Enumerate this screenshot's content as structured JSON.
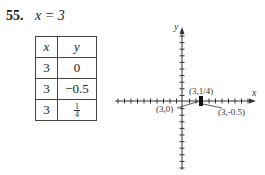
{
  "problem": {
    "number": "55.",
    "equation": "x = 3"
  },
  "table": {
    "headers": [
      "x",
      "y"
    ],
    "rows": [
      {
        "x": "3",
        "y": "0"
      },
      {
        "x": "3",
        "y": "−0.5"
      },
      {
        "x": "3",
        "y_num": "1",
        "y_den": "4"
      }
    ]
  },
  "chart_data": {
    "type": "scatter",
    "title": "",
    "xlabel": "x",
    "ylabel": "y",
    "points": [
      {
        "x": 3,
        "y": 0,
        "label": "(3,0)"
      },
      {
        "x": 3,
        "y": -0.5,
        "label": "(3,-0.5)"
      },
      {
        "x": 3,
        "y": 0.25,
        "label": "(3,1/4)"
      }
    ],
    "xlim": [
      -10,
      10
    ],
    "ylim": [
      -10,
      10
    ],
    "grid": false,
    "ticks": "unit tick marks on both axes"
  },
  "graph": {
    "x_axis_label": "x",
    "y_axis_label": "y",
    "labels": {
      "p1": "(3,1/4)",
      "p0": "(3,0)",
      "p2": "(3,-0.5)"
    }
  }
}
